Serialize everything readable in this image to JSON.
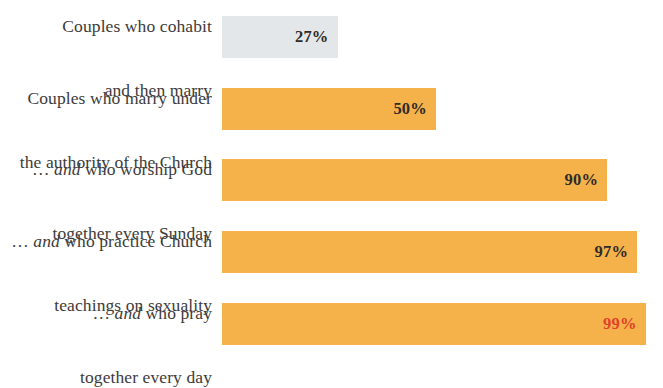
{
  "chart_data": {
    "type": "bar",
    "title": "",
    "subtitle": "",
    "xlabel": "",
    "ylabel": "",
    "xlim": [
      0,
      100
    ],
    "grid": false,
    "legend": null,
    "orientation": "horizontal",
    "value_suffix": "%",
    "categories": [
      "Couples who cohabit and then marry",
      "Couples who marry under the authority of the Church",
      "… and who worship God together every Sunday",
      "… and who practice Church teachings on sexuality",
      "… and who pray together every day"
    ],
    "values": [
      27,
      50,
      90,
      97,
      99
    ],
    "value_labels": [
      "27%",
      "50%",
      "90%",
      "97%",
      "99%"
    ]
  },
  "colors": {
    "bar_highlight": "#F5B24A",
    "bar_muted": "#E3E7EA",
    "value_default": "#2e2b28",
    "value_accent": "#E2402A",
    "label_text": "#3d3b3a",
    "background": "#ffffff"
  },
  "rows": [
    {
      "label_line1_pre": "Couples who cohabit",
      "label_line1_em": "",
      "label_line1_post": "",
      "label_line2": "and then marry",
      "value_label": "27%",
      "value": 27,
      "bar_color_key": "bar_muted",
      "value_color_key": "value_default"
    },
    {
      "label_line1_pre": "Couples who marry under",
      "label_line1_em": "",
      "label_line1_post": "",
      "label_line2": "the authority of the Church",
      "value_label": "50%",
      "value": 50,
      "bar_color_key": "bar_highlight",
      "value_color_key": "value_default"
    },
    {
      "label_line1_pre": "… ",
      "label_line1_em": "and",
      "label_line1_post": " who worship God",
      "label_line2": "together every Sunday",
      "value_label": "90%",
      "value": 90,
      "bar_color_key": "bar_highlight",
      "value_color_key": "value_default"
    },
    {
      "label_line1_pre": "… ",
      "label_line1_em": "and",
      "label_line1_post": " who practice Church",
      "label_line2": "teachings on sexuality",
      "value_label": "97%",
      "value": 97,
      "bar_color_key": "bar_highlight",
      "value_color_key": "value_default"
    },
    {
      "label_line1_pre": "… ",
      "label_line1_em": "and",
      "label_line1_post": " who pray",
      "label_line2": "together every day",
      "value_label": "99%",
      "value": 99,
      "bar_color_key": "bar_highlight",
      "value_color_key": "value_accent"
    }
  ],
  "layout": {
    "bar_origin_x": 232,
    "px_per_percent": 4.28,
    "row_tops": [
      16,
      88,
      159,
      231,
      303
    ],
    "bar_height": 42
  }
}
